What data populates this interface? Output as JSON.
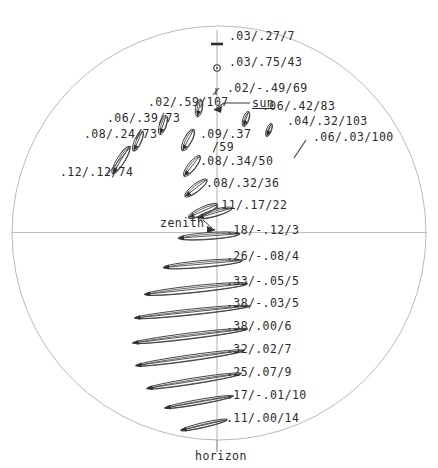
{
  "figure": {
    "type": "all-sky-polarization-diagram",
    "horizon_label": "horizon",
    "zenith_label": "zenith",
    "sun_label": "sun",
    "line_color": "#3a3a3a",
    "circle_color": "#b9b9b9",
    "axis_color": "#bdbdbd",
    "text_color": "#2b2b2b"
  },
  "chart_data": {
    "type": "scatter",
    "title": "",
    "xlabel": "",
    "ylabel": "",
    "grid": false,
    "legend": null,
    "axis_markers": [
      {
        "name": "zenith",
        "x": 217,
        "y": 232
      },
      {
        "name": "sun",
        "x": 213,
        "y": 110
      },
      {
        "name": "horizon",
        "x": 223,
        "y": 455
      }
    ],
    "labels": [
      {
        "text": ".03/.27/7",
        "x": 229,
        "y": 30,
        "marker_x": 217,
        "marker_y": 44,
        "marker": "dash"
      },
      {
        "text": ".03/.75/43",
        "x": 229,
        "y": 56,
        "marker_x": 217,
        "marker_y": 68,
        "marker": "circle"
      },
      {
        "text": ".02/-.49/69",
        "x": 227,
        "y": 82,
        "marker_x": 216,
        "marker_y": 92,
        "marker": "tick"
      },
      {
        "text": ".02/.59/107",
        "x": 148,
        "y": 96,
        "marker_x": 199,
        "marker_y": 108,
        "marker": "ellipse"
      },
      {
        "text": ".06/.42/83",
        "x": 262,
        "y": 100,
        "marker_x": 246,
        "marker_y": 118,
        "marker": "ellipse"
      },
      {
        "text": ".06/.39/73",
        "x": 107,
        "y": 112,
        "marker_x": 163,
        "marker_y": 125,
        "marker": "ellipse"
      },
      {
        "text": ".04/.32/103",
        "x": 287,
        "y": 115,
        "marker_x": 269,
        "marker_y": 130,
        "marker": "ellipse"
      },
      {
        "text": ".09/.37",
        "x": 200,
        "y": 128,
        "marker_x": 188,
        "marker_y": 140,
        "marker": "ellipse"
      },
      {
        "text": "/59",
        "x": 212,
        "y": 141,
        "marker_x": null,
        "marker_y": null,
        "marker": "none"
      },
      {
        "text": ".08/.24/73",
        "x": 84,
        "y": 128,
        "marker_x": 138,
        "marker_y": 140,
        "marker": "ellipse"
      },
      {
        "text": ".06/.03/100",
        "x": 313,
        "y": 131,
        "marker_x": 300,
        "marker_y": 152,
        "marker": "stroke"
      },
      {
        "text": ".08/.34/50",
        "x": 200,
        "y": 155,
        "marker_x": 188,
        "marker_y": 166,
        "marker": "ellipse"
      },
      {
        "text": ".12/.12/74",
        "x": 60,
        "y": 166,
        "marker_x": 120,
        "marker_y": 160,
        "marker": "ellipse"
      },
      {
        "text": ".08/.32/36",
        "x": 206,
        "y": 177,
        "marker_x": 194,
        "marker_y": 188,
        "marker": "ellipse"
      },
      {
        "text": ".11/.17/22",
        "x": 214,
        "y": 199,
        "marker_x": 200,
        "marker_y": 210,
        "marker": "ellipse"
      },
      {
        "text": ".18/-.12/3",
        "x": 226,
        "y": 224,
        "marker_x": 210,
        "marker_y": 236,
        "marker": "ellipse"
      },
      {
        "text": ".26/-.08/4",
        "x": 226,
        "y": 250,
        "marker_x": 205,
        "marker_y": 263,
        "marker": "ellipse"
      },
      {
        "text": ".33/-.05/5",
        "x": 226,
        "y": 275,
        "marker_x": 198,
        "marker_y": 288,
        "marker": "ellipse"
      },
      {
        "text": ".38/-.03/5",
        "x": 226,
        "y": 297,
        "marker_x": 193,
        "marker_y": 312,
        "marker": "ellipse"
      },
      {
        "text": ".38/.00/6",
        "x": 226,
        "y": 320,
        "marker_x": 190,
        "marker_y": 336,
        "marker": "ellipse"
      },
      {
        "text": ".32/.02/7",
        "x": 226,
        "y": 343,
        "marker_x": 190,
        "marker_y": 358,
        "marker": "ellipse"
      },
      {
        "text": ".25/.07/9",
        "x": 226,
        "y": 366,
        "marker_x": 193,
        "marker_y": 380,
        "marker": "ellipse"
      },
      {
        "text": ".17/-.01/10",
        "x": 226,
        "y": 389,
        "marker_x": 198,
        "marker_y": 401,
        "marker": "ellipse"
      },
      {
        "text": ".11/.00/14",
        "x": 226,
        "y": 412,
        "marker_x": 202,
        "marker_y": 424,
        "marker": "ellipse"
      }
    ],
    "ellipses": [
      {
        "cx": 199,
        "cy": 108,
        "rx": 9,
        "ry": 3.5,
        "rot": 80
      },
      {
        "cx": 246,
        "cy": 119,
        "rx": 8,
        "ry": 3,
        "rot": 72
      },
      {
        "cx": 163,
        "cy": 125,
        "rx": 10,
        "ry": 3.5,
        "rot": 72
      },
      {
        "cx": 269,
        "cy": 130,
        "rx": 7,
        "ry": 2.5,
        "rot": 70
      },
      {
        "cx": 188,
        "cy": 140,
        "rx": 12,
        "ry": 4,
        "rot": 62
      },
      {
        "cx": 138,
        "cy": 141,
        "rx": 11,
        "ry": 3.5,
        "rot": 66
      },
      {
        "cx": 192,
        "cy": 166,
        "rx": 13,
        "ry": 4,
        "rot": 52
      },
      {
        "cx": 121,
        "cy": 160,
        "rx": 16,
        "ry": 4,
        "rot": 58
      },
      {
        "cx": 196,
        "cy": 188,
        "rx": 14,
        "ry": 4,
        "rot": 38
      },
      {
        "cx": 203,
        "cy": 211,
        "rx": 16,
        "ry": 4,
        "rot": 24
      },
      {
        "cx": 215,
        "cy": 213,
        "rx": 18,
        "ry": 3.5,
        "rot": 16
      },
      {
        "cx": 209,
        "cy": 236,
        "rx": 31,
        "ry": 3.5,
        "rot": 4
      },
      {
        "cx": 203,
        "cy": 264,
        "rx": 40,
        "ry": 3.5,
        "rot": 5
      },
      {
        "cx": 196,
        "cy": 289,
        "rx": 52,
        "ry": 3.5,
        "rot": 6
      },
      {
        "cx": 192,
        "cy": 312,
        "rx": 58,
        "ry": 3,
        "rot": 6
      },
      {
        "cx": 190,
        "cy": 336,
        "rx": 58,
        "ry": 3,
        "rot": 7
      },
      {
        "cx": 190,
        "cy": 358,
        "rx": 55,
        "ry": 3,
        "rot": 8
      },
      {
        "cx": 194,
        "cy": 381,
        "rx": 48,
        "ry": 3,
        "rot": 9
      },
      {
        "cx": 199,
        "cy": 402,
        "rx": 35,
        "ry": 2.5,
        "rot": 10
      },
      {
        "cx": 204,
        "cy": 425,
        "rx": 24,
        "ry": 2.5,
        "rot": 13
      }
    ]
  }
}
